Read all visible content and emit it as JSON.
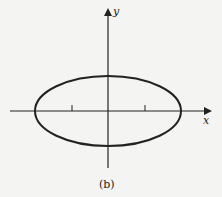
{
  "figure": {
    "caption": "(b)",
    "x_axis_label": "x",
    "y_axis_label": "y",
    "shape": "ellipse",
    "x_ticks": 2,
    "colors": {
      "background": "#f4f4f2",
      "ink": "#222222"
    }
  }
}
